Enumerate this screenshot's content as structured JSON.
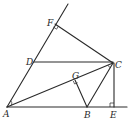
{
  "diagram": {
    "type": "geometry",
    "points": {
      "A": {
        "label": "A",
        "x": 7,
        "y": 107
      },
      "B": {
        "label": "B",
        "x": 87,
        "y": 107
      },
      "C": {
        "label": "C",
        "x": 113,
        "y": 63
      },
      "D": {
        "label": "D",
        "x": 34,
        "y": 62
      },
      "E": {
        "label": "E",
        "x": 115,
        "y": 107
      },
      "F": {
        "label": "F",
        "x": 55,
        "y": 24
      },
      "G": {
        "label": "G",
        "x": 75,
        "y": 80
      }
    },
    "segments": [
      "AF (ray)",
      "AE (ray)",
      "FC",
      "DC",
      "AC",
      "GB",
      "BC",
      "CE"
    ],
    "right_angles": [
      "F",
      "G",
      "E"
    ],
    "angle_marks": [
      "A (between AF and AC)",
      "C"
    ],
    "colors": {
      "stroke": "#2a2a2a",
      "background": "#ffffff"
    }
  }
}
